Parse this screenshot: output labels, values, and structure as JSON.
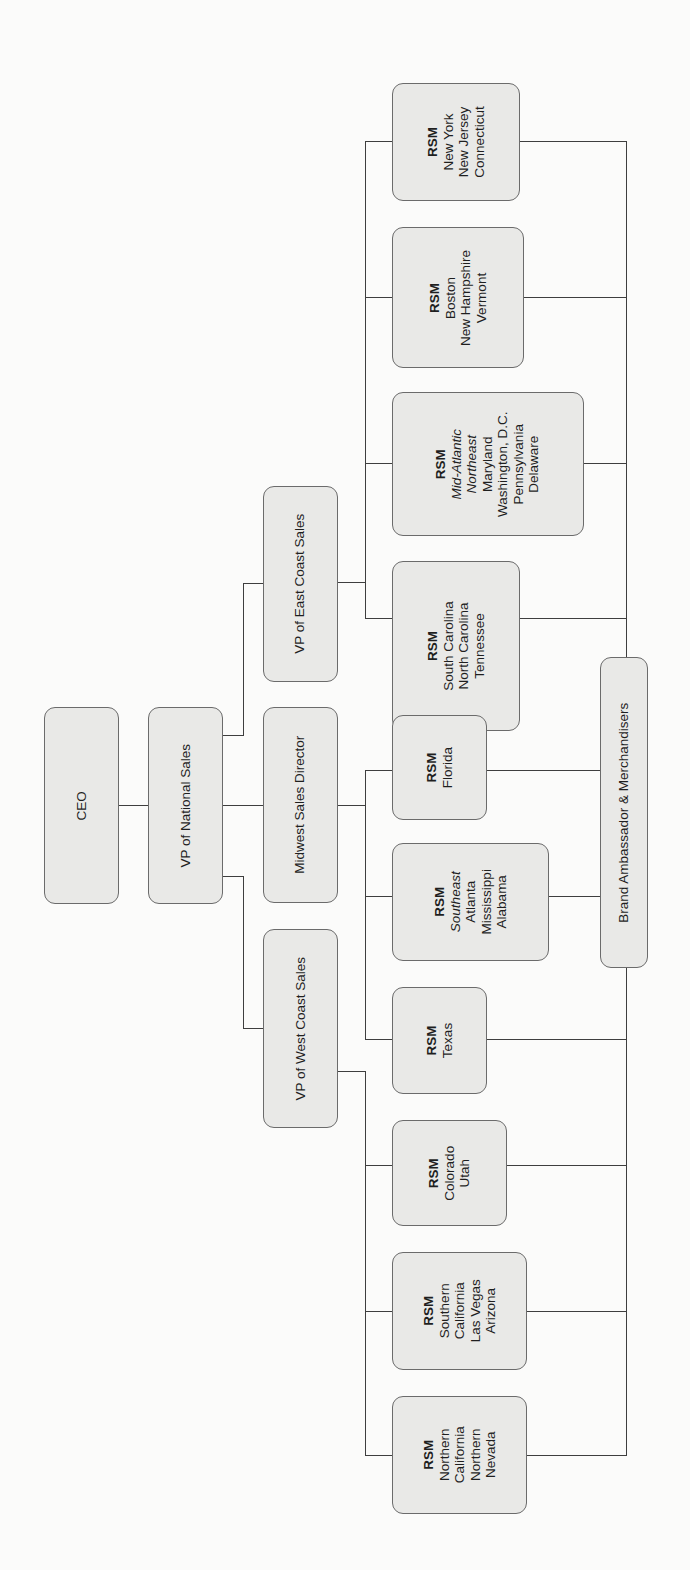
{
  "chart": {
    "title": "",
    "orientation": "rotated-90-ccw",
    "colors": {
      "box_fill": "#e9e9e7",
      "box_border": "#6b6b6b",
      "line": "#3e3e3e",
      "background": "#fbfbfa"
    },
    "ceo": {
      "label": "CEO"
    },
    "vp_national": {
      "label": "VP of National Sales"
    },
    "vp_east": {
      "label": "VP of East Coast Sales"
    },
    "midwest": {
      "label": "Midwest Sales Director"
    },
    "vp_west": {
      "label": "VP of West Coast Sales"
    },
    "brand": {
      "label": "Brand Ambassador & Merchandisers"
    },
    "rsm": {
      "ny": {
        "title": "RSM",
        "lines": [
          "New York",
          "New Jersey",
          "Connecticut"
        ]
      },
      "boston": {
        "title": "RSM",
        "lines": [
          "Boston",
          "New Hampshire",
          "Vermont"
        ]
      },
      "midatl": {
        "title": "RSM",
        "italic": [
          "Mid-Atlantic",
          "Northeast"
        ],
        "lines": [
          "Maryland",
          "Washington, D.C.",
          "Pennsylvania",
          "Delaware"
        ]
      },
      "sc": {
        "title": "RSM",
        "lines": [
          "South Carolina",
          "North Carolina",
          "Tennessee"
        ]
      },
      "florida": {
        "title": "RSM",
        "lines": [
          "Florida"
        ]
      },
      "southeast": {
        "title": "RSM",
        "italic": [
          "Southeast"
        ],
        "lines": [
          "Atlanta",
          "Mississippi",
          "Alabama"
        ]
      },
      "texas": {
        "title": "RSM",
        "lines": [
          "Texas"
        ]
      },
      "colorado": {
        "title": "RSM",
        "lines": [
          "Colorado",
          "Utah"
        ]
      },
      "socal": {
        "title": "RSM",
        "lines": [
          "Southern",
          "California",
          "Las Vegas",
          "Arizona"
        ]
      },
      "norcal": {
        "title": "RSM",
        "lines": [
          "Northern",
          "California",
          "Northern",
          "Nevada"
        ]
      }
    }
  }
}
